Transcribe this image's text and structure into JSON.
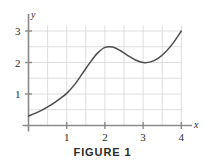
{
  "figure": {
    "caption": "FIGURE 1",
    "background_color": "#ffffff",
    "axis_color": "#8a8a8a",
    "grid_color": "#d6d6d6",
    "curve_color": "#4d4d4d",
    "text_color": "#2b2b2b"
  },
  "chart_data": {
    "type": "line",
    "title": "FIGURE 1",
    "xlabel": "x",
    "ylabel": "y",
    "xlim": [
      0,
      4.2
    ],
    "ylim": [
      0,
      3.25
    ],
    "grid": true,
    "grid_step": 0.5,
    "legend": null,
    "x_ticks": [
      1,
      2,
      3,
      4
    ],
    "x_tick_labels": [
      "1",
      "2",
      "3",
      "4"
    ],
    "y_ticks": [
      1,
      2,
      3
    ],
    "y_tick_labels": [
      "1",
      "2",
      "3"
    ],
    "series": [
      {
        "name": "f",
        "x": [
          0.0,
          0.2,
          0.4,
          0.6,
          0.8,
          1.0,
          1.2,
          1.4,
          1.6,
          1.8,
          2.0,
          2.2,
          2.4,
          2.6,
          2.8,
          3.0,
          3.2,
          3.4,
          3.6,
          3.8,
          4.0
        ],
        "y": [
          0.3,
          0.4,
          0.52,
          0.66,
          0.83,
          1.02,
          1.29,
          1.63,
          1.98,
          2.29,
          2.48,
          2.49,
          2.38,
          2.22,
          2.08,
          2.0,
          2.02,
          2.14,
          2.35,
          2.64,
          3.0
        ]
      }
    ],
    "annotations": [
      {
        "label": "local maximum",
        "x": 2.05,
        "y": 2.5
      },
      {
        "label": "local minimum",
        "x": 3.0,
        "y": 2.0
      }
    ]
  },
  "axes": {
    "x_axis_label": "x",
    "y_axis_label": "y"
  }
}
